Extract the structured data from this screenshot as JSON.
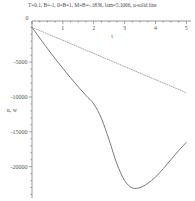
{
  "chart_data": {
    "type": "line",
    "title": "T=0.1, B=-1, 0=B=1, M=B=-.1836, lam=5.1066, u-solid line",
    "xlabel": "t",
    "ylabel": "u, w",
    "xlim": [
      0,
      5.15
    ],
    "ylim": [
      -24500,
      900
    ],
    "grid": false,
    "legend": "none",
    "xticks": [
      0,
      1,
      2,
      3,
      4,
      5
    ],
    "xtick_labels": [
      "0",
      "1",
      "2",
      "3",
      "4",
      "5"
    ],
    "yticks": [
      -5000,
      -10000,
      -15000,
      -20000
    ],
    "ytick_labels": [
      "-5000",
      "-10000",
      "-15000",
      "-20000"
    ],
    "y_minor_tick_step": 1000,
    "x_minor_tick_step": 0.25,
    "series": [
      {
        "name": "u",
        "style": "solid",
        "color": "#606060",
        "x": [
          0.0,
          0.1,
          0.2,
          0.3,
          0.4,
          0.5,
          0.75,
          1.0,
          1.25,
          1.5,
          1.75,
          2.0,
          2.25,
          2.5,
          2.75,
          3.0,
          3.25,
          3.5,
          3.75,
          4.0,
          4.25,
          4.5,
          4.75,
          5.0
        ],
        "y": [
          0,
          -620,
          -1240,
          -1850,
          -2450,
          -3050,
          -4500,
          -5900,
          -7250,
          -8550,
          -9800,
          -11000,
          -13100,
          -16200,
          -19600,
          -22000,
          -23050,
          -23000,
          -22400,
          -21500,
          -20300,
          -19000,
          -17700,
          -16500
        ]
      },
      {
        "name": "w",
        "style": "dotted",
        "color": "#8a8a8a",
        "x": [
          0.0,
          0.25,
          0.5,
          0.75,
          1.0,
          1.25,
          1.5,
          1.75,
          2.0,
          2.25,
          2.5,
          2.75,
          3.0,
          3.25,
          3.5,
          3.75,
          4.0,
          4.25,
          4.5,
          4.75,
          5.0
        ],
        "y": [
          0,
          -470,
          -940,
          -1410,
          -1880,
          -2350,
          -2820,
          -3290,
          -3760,
          -4230,
          -4700,
          -5170,
          -5640,
          -6110,
          -6580,
          -7050,
          -7520,
          -7990,
          -8460,
          -8930,
          -9400
        ]
      }
    ]
  }
}
